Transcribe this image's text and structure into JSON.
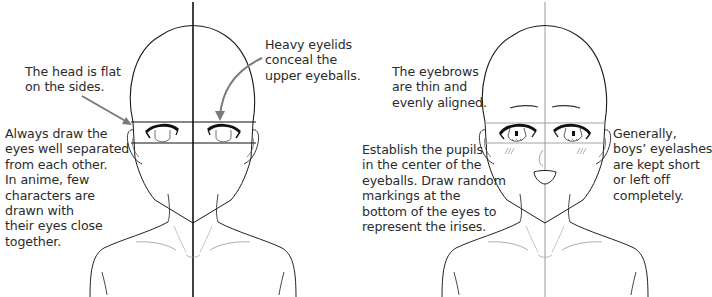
{
  "left_figure": {
    "label": "eye placement guide (no features)",
    "annotations": {
      "head_flat": "The head is flat\non the sides.",
      "heavy_eyelids": "Heavy eyelids\nconceal the\nupper eyeballs.",
      "eyes_separated": "Always draw the\neyes well separated\nfrom each other.\nIn anime, few\ncharacters are\ndrawn with\ntheir eyes close\ntogether."
    }
  },
  "right_figure": {
    "label": "eyes, eyebrows and mouth added",
    "annotations": {
      "eyebrows": "The eyebrows\nare thin and\nevenly aligned.",
      "pupils": "Establish the pupils\nin the center of the\neyeballs. Draw random\nmarkings at the\nbottom of the eyes to\nrepresent the irises.",
      "eyelashes": "Generally,\nboys’ eyelashes\nare kept short\nor left off\ncompletely."
    }
  },
  "colors": {
    "ink": "#1a1a1a",
    "guide_dark": "#111111",
    "guide_light": "#9a9a9a",
    "arrow": "#7a7a7a",
    "text": "#2b2b2b"
  }
}
